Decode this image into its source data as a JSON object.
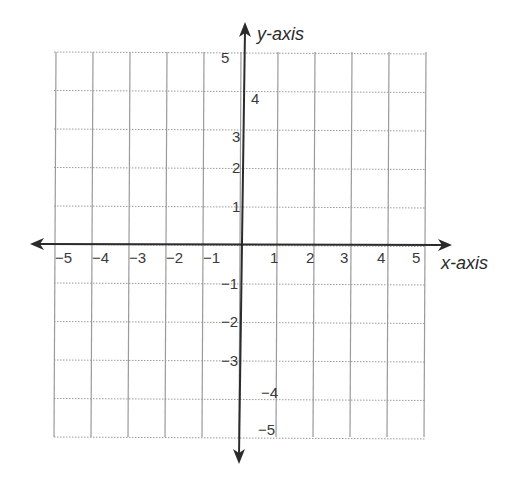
{
  "diagram": {
    "type": "coordinate-plane",
    "x_axis": {
      "label": "x-axis",
      "range": [
        -5,
        5
      ],
      "ticks": [
        {
          "value": -5,
          "label": "−5"
        },
        {
          "value": -4,
          "label": "−4"
        },
        {
          "value": -3,
          "label": "−3"
        },
        {
          "value": -2,
          "label": "−2"
        },
        {
          "value": -1,
          "label": "−1"
        },
        {
          "value": 1,
          "label": "1"
        },
        {
          "value": 2,
          "label": "2"
        },
        {
          "value": 3,
          "label": "3"
        },
        {
          "value": 4,
          "label": "4"
        },
        {
          "value": 5,
          "label": "5"
        }
      ]
    },
    "y_axis": {
      "label": "y-axis",
      "range": [
        -5,
        5
      ],
      "ticks": [
        {
          "value": 5,
          "label": "5"
        },
        {
          "value": 4,
          "label": "4"
        },
        {
          "value": 3,
          "label": "3"
        },
        {
          "value": 2,
          "label": "2"
        },
        {
          "value": 1,
          "label": "1"
        },
        {
          "value": -1,
          "label": "−1"
        },
        {
          "value": -2,
          "label": "−2"
        },
        {
          "value": -3,
          "label": "−3"
        },
        {
          "value": -4,
          "label": "−4"
        },
        {
          "value": -5,
          "label": "−5"
        }
      ]
    },
    "grid": {
      "columns": 10,
      "rows": 10,
      "vertical_style": "solid",
      "horizontal_style": "dotted"
    },
    "colors": {
      "grid": "#9a9a9a",
      "axis": "#2b2b2b",
      "text": "#3a3a3a"
    }
  }
}
